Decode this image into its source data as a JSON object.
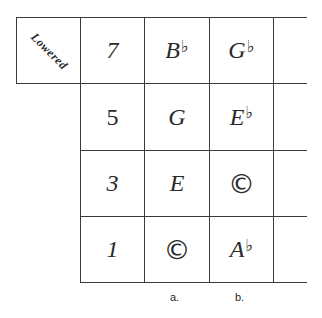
{
  "table": {
    "corner_label": "Lowered",
    "rows": [
      {
        "degree": "7",
        "a": {
          "note": "B",
          "accidental": "♭"
        },
        "b": {
          "note": "G",
          "accidental": "♭"
        }
      },
      {
        "degree": "5",
        "a": {
          "note": "G",
          "accidental": ""
        },
        "b": {
          "note": "E",
          "accidental": "♭"
        }
      },
      {
        "degree": "3",
        "a": {
          "note": "E",
          "accidental": ""
        },
        "b": {
          "note": "©",
          "accidental": ""
        }
      },
      {
        "degree": "1",
        "a": {
          "note": "©",
          "accidental": ""
        },
        "b": {
          "note": "A",
          "accidental": "♭"
        }
      }
    ],
    "column_labels": [
      "a.",
      "b."
    ]
  }
}
